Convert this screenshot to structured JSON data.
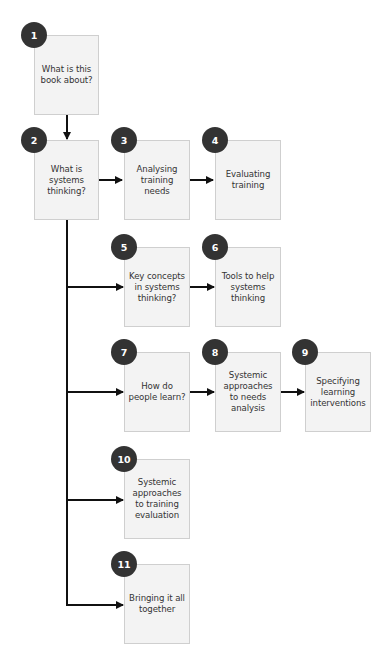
{
  "diagram": {
    "colors": {
      "badge": "#333333",
      "badge_text": "#ffffff",
      "box_fill": "#f3f3f3",
      "box_border": "#cfcfcf",
      "text": "#333333",
      "connector": "#111111"
    },
    "nodes": [
      {
        "id": "1",
        "number": "1",
        "label": "What is this book about?"
      },
      {
        "id": "2",
        "number": "2",
        "label": "What is systems thinking?"
      },
      {
        "id": "3",
        "number": "3",
        "label": "Analysing training needs"
      },
      {
        "id": "4",
        "number": "4",
        "label": "Evaluating training"
      },
      {
        "id": "5",
        "number": "5",
        "label": "Key concepts in systems thinking?"
      },
      {
        "id": "6",
        "number": "6",
        "label": "Tools to help systems thinking"
      },
      {
        "id": "7",
        "number": "7",
        "label": "How do people learn?"
      },
      {
        "id": "8",
        "number": "8",
        "label": "Systemic approaches to needs analysis"
      },
      {
        "id": "9",
        "number": "9",
        "label": "Specifying learning interventions"
      },
      {
        "id": "10",
        "number": "10",
        "label": "Systemic approaches to training evaluation"
      },
      {
        "id": "11",
        "number": "11",
        "label": "Bringing it all together"
      }
    ],
    "edges": [
      {
        "from": "1",
        "to": "2"
      },
      {
        "from": "2",
        "to": "3"
      },
      {
        "from": "3",
        "to": "4"
      },
      {
        "from": "2",
        "to": "5"
      },
      {
        "from": "5",
        "to": "6"
      },
      {
        "from": "2",
        "to": "7"
      },
      {
        "from": "7",
        "to": "8"
      },
      {
        "from": "8",
        "to": "9"
      },
      {
        "from": "2",
        "to": "10"
      },
      {
        "from": "2",
        "to": "11"
      }
    ]
  }
}
